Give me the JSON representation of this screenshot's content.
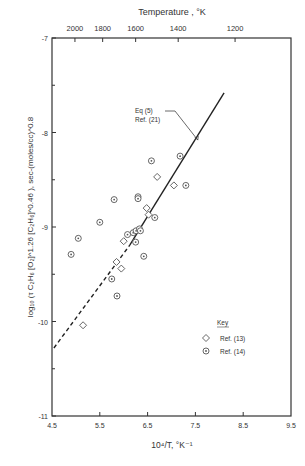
{
  "chart_data": {
    "type": "scatter",
    "title": "",
    "top_axis": {
      "label": "Temperature , °K",
      "ticks": [
        {
          "label": "2000",
          "x": 4.98
        },
        {
          "label": "1800",
          "x": 5.56
        },
        {
          "label": "1600",
          "x": 6.25
        },
        {
          "label": "1400",
          "x": 7.14
        },
        {
          "label": "1200",
          "x": 8.33
        }
      ]
    },
    "xlabel": "10⁴/T, °K⁻¹",
    "ylabel": "log₁₀ (τ C₂H₆ [O₂]^1.26 [C₂H₆]^0.46 ), sec-(moles/cc)^0.8",
    "xlim": [
      4.5,
      9.5
    ],
    "ylim": [
      -11,
      -7
    ],
    "x_ticks": [
      "4.5",
      "5.5",
      "6.5",
      "7.5",
      "8.5",
      "9.5"
    ],
    "x_tick_values": [
      4.5,
      5.5,
      6.5,
      7.5,
      8.5,
      9.5
    ],
    "y_ticks": [
      "-7",
      "-8",
      "-9",
      "-10",
      "-11"
    ],
    "y_tick_values": [
      -7,
      -8,
      -9,
      -10,
      -11
    ],
    "y_minor_ticks": [
      -7.5,
      -8.5,
      -9.5,
      -10.5
    ],
    "grid": false,
    "line": {
      "name": "Eq (5) Ref. (21)",
      "solid": [
        [
          6.13,
          -9.19
        ],
        [
          8.1,
          -7.58
        ]
      ],
      "dashed": [
        [
          4.54,
          -10.28
        ],
        [
          6.13,
          -9.19
        ]
      ]
    },
    "annotation": {
      "lines": [
        "Eq (5)",
        "Ref. (21)"
      ],
      "x": 6.0,
      "y": -8.7,
      "arrow_to": [
        7.55,
        -8.08
      ]
    },
    "legend": {
      "title": "Key",
      "position": "lower right",
      "entries": [
        {
          "marker": "diamond",
          "label": "Ref. (13)"
        },
        {
          "marker": "circle-dot",
          "label": "Ref. (14)"
        }
      ]
    },
    "series": [
      {
        "name": "Ref. (13)",
        "marker": "diamond",
        "points": [
          [
            7.05,
            -8.56
          ],
          [
            6.7,
            -8.47
          ],
          [
            6.52,
            -8.87
          ],
          [
            6.48,
            -8.8
          ],
          [
            6.0,
            -9.15
          ],
          [
            5.85,
            -9.37
          ],
          [
            5.95,
            -9.44
          ],
          [
            5.15,
            -10.04
          ]
        ]
      },
      {
        "name": "Ref. (14)",
        "marker": "circle-dot",
        "points": [
          [
            7.18,
            -8.25
          ],
          [
            6.58,
            -8.3
          ],
          [
            7.3,
            -8.56
          ],
          [
            6.3,
            -8.68
          ],
          [
            6.3,
            -8.7
          ],
          [
            6.65,
            -8.9
          ],
          [
            5.8,
            -8.71
          ],
          [
            5.5,
            -8.95
          ],
          [
            5.05,
            -9.12
          ],
          [
            6.2,
            -9.06
          ],
          [
            6.26,
            -9.04
          ],
          [
            6.33,
            -9.02
          ],
          [
            6.08,
            -9.08
          ],
          [
            6.25,
            -9.16
          ],
          [
            6.35,
            -9.04
          ],
          [
            4.9,
            -9.29
          ],
          [
            6.42,
            -9.31
          ],
          [
            5.75,
            -9.55
          ],
          [
            5.86,
            -9.73
          ]
        ]
      }
    ]
  }
}
